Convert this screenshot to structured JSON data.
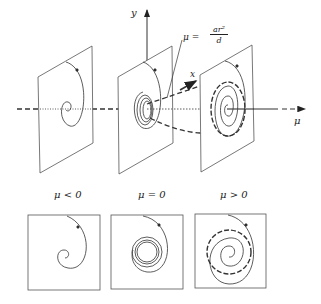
{
  "figure": {
    "axis_labels": {
      "y": "y",
      "x": "x",
      "mu": "μ"
    },
    "annotation": {
      "lhs": "μ =",
      "numerator": "ar²",
      "denominator": "d"
    },
    "panel_labels": [
      "μ < 0",
      "μ = 0",
      "μ > 0"
    ],
    "colors": {
      "ink": "#222222",
      "background": "#ffffff"
    },
    "panels": [
      {
        "name": "stable-spiral",
        "condition": "μ < 0"
      },
      {
        "name": "weakly-stable-spiral",
        "condition": "μ = 0"
      },
      {
        "name": "limit-cycle",
        "condition": "μ > 0"
      }
    ]
  }
}
